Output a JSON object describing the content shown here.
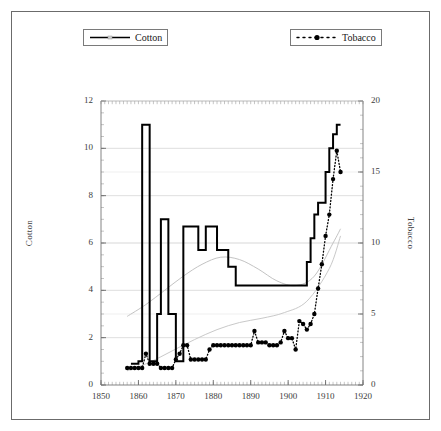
{
  "figure": {
    "background_color": "#ffffff",
    "frame_color": "#6b6b6b"
  },
  "legend": {
    "position": "top",
    "entries": [
      {
        "label": "Cotton",
        "style": "solid-line",
        "color": "#000000",
        "icon": "solid-line-icon"
      },
      {
        "label": "Tobacco",
        "style": "dotted-line-with-marker",
        "color": "#000000",
        "icon": "dotted-line-marker-icon"
      }
    ]
  },
  "chart_data": {
    "type": "line",
    "title": "",
    "subtitle": "",
    "xlabel": "",
    "ylabel": "Cotton",
    "y2label": "Tobacco",
    "xlim": [
      1850,
      1920
    ],
    "ylim": [
      0,
      12
    ],
    "y2lim": [
      0,
      20
    ],
    "xticks": [
      1850,
      1860,
      1870,
      1880,
      1890,
      1900,
      1910,
      1920
    ],
    "xtick_labels": [
      "1850",
      "1860",
      "1870",
      "1880",
      "1890",
      "1900",
      "1910",
      "1920"
    ],
    "x_minor_tick_interval": 1,
    "yticks": [
      0,
      2,
      4,
      6,
      8,
      10,
      12
    ],
    "ytick_labels": [
      "0",
      "2",
      "4",
      "6",
      "8",
      "10",
      "12"
    ],
    "y2ticks": [
      0,
      5,
      10,
      15,
      20
    ],
    "y2tick_labels": [
      "0",
      "5",
      "10",
      "15",
      "20"
    ],
    "grid": true,
    "grid_color": "#c9c9c9",
    "legend_position": "top",
    "series": [
      {
        "name": "Cotton",
        "axis": "left",
        "color": "#000000",
        "style": "solid",
        "line_width": 2,
        "markers": false,
        "x": [
          1858,
          1859,
          1860,
          1861,
          1862,
          1863,
          1864,
          1865,
          1866,
          1867,
          1868,
          1869,
          1870,
          1871,
          1872,
          1873,
          1874,
          1875,
          1876,
          1877,
          1878,
          1879,
          1880,
          1881,
          1882,
          1883,
          1884,
          1885,
          1886,
          1887,
          1888,
          1889,
          1890,
          1891,
          1892,
          1893,
          1894,
          1895,
          1896,
          1897,
          1898,
          1899,
          1900,
          1901,
          1902,
          1903,
          1904,
          1905,
          1906,
          1907,
          1908,
          1909,
          1910,
          1911,
          1912,
          1913,
          1914
        ],
        "y": [
          0.9,
          0.9,
          1.0,
          11.0,
          11.0,
          1.0,
          1.0,
          3.0,
          7.0,
          7.0,
          3.0,
          3.0,
          1.0,
          1.0,
          6.7,
          6.7,
          6.7,
          6.7,
          5.7,
          5.7,
          6.7,
          6.7,
          6.7,
          5.7,
          5.7,
          5.7,
          5.0,
          5.0,
          4.2,
          4.2,
          4.2,
          4.2,
          4.2,
          4.2,
          4.2,
          4.2,
          4.2,
          4.2,
          4.2,
          4.2,
          4.2,
          4.2,
          4.2,
          4.2,
          4.2,
          4.2,
          4.2,
          5.2,
          6.2,
          7.2,
          7.7,
          7.7,
          9.0,
          10.0,
          10.6,
          11.0,
          11.0
        ]
      },
      {
        "name": "Tobacco",
        "axis": "right",
        "color": "#000000",
        "style": "dotted",
        "line_width": 1,
        "markers": true,
        "marker": "circle",
        "x": [
          1857,
          1858,
          1859,
          1860,
          1861,
          1862,
          1863,
          1864,
          1865,
          1866,
          1867,
          1868,
          1869,
          1870,
          1871,
          1872,
          1873,
          1874,
          1875,
          1876,
          1877,
          1878,
          1879,
          1880,
          1881,
          1882,
          1883,
          1884,
          1885,
          1886,
          1887,
          1888,
          1889,
          1890,
          1891,
          1892,
          1893,
          1894,
          1895,
          1896,
          1897,
          1898,
          1899,
          1900,
          1901,
          1902,
          1903,
          1904,
          1905,
          1906,
          1907,
          1908,
          1909,
          1910,
          1911,
          1912,
          1913,
          1914
        ],
        "y": [
          1.2,
          1.2,
          1.2,
          1.2,
          1.2,
          2.2,
          1.5,
          1.5,
          1.5,
          1.2,
          1.2,
          1.2,
          1.2,
          1.8,
          2.2,
          2.8,
          2.8,
          1.8,
          1.8,
          1.8,
          1.8,
          1.8,
          2.5,
          2.8,
          2.8,
          2.8,
          2.8,
          2.8,
          2.8,
          2.8,
          2.8,
          2.8,
          2.8,
          2.8,
          3.8,
          3.0,
          3.0,
          3.0,
          2.8,
          2.8,
          2.8,
          3.0,
          3.8,
          3.3,
          3.3,
          2.5,
          4.5,
          4.3,
          3.9,
          4.3,
          5.0,
          6.8,
          8.5,
          10.5,
          12.0,
          14.5,
          16.5,
          15.0
        ],
        "y_note": "values read on right-hand Tobacco axis (0-20)"
      },
      {
        "name": "Cotton trend",
        "axis": "left",
        "color": "#c3c3c3",
        "style": "smooth-faint",
        "line_width": 1,
        "markers": false,
        "x": [
          1857,
          1862,
          1867,
          1872,
          1877,
          1882,
          1887,
          1892,
          1897,
          1902,
          1907,
          1912,
          1914
        ],
        "y": [
          2.9,
          3.4,
          4.0,
          4.6,
          5.1,
          5.4,
          5.3,
          4.9,
          4.4,
          4.2,
          4.6,
          6.0,
          6.6
        ]
      },
      {
        "name": "Tobacco trend",
        "axis": "right",
        "color": "#c9c9c9",
        "style": "smooth-faint",
        "line_width": 1,
        "markers": false,
        "x": [
          1857,
          1863,
          1869,
          1875,
          1881,
          1887,
          1893,
          1899,
          1905,
          1911,
          1914
        ],
        "y": [
          1.0,
          1.6,
          2.4,
          3.2,
          3.9,
          4.4,
          4.7,
          5.1,
          5.9,
          8.2,
          10.5
        ]
      }
    ],
    "annotations": []
  }
}
